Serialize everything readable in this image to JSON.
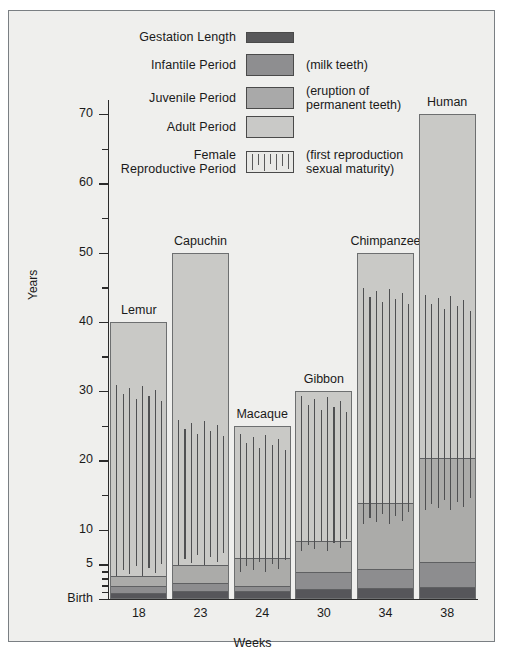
{
  "chart_data": {
    "type": "bar",
    "title": "",
    "subtitle": "",
    "xlabel": "Weeks",
    "ylabel": "Years",
    "ylim": [
      0,
      73
    ],
    "grid": false,
    "legend_position": "top-center",
    "y_ticks_major": [
      {
        "value": 0,
        "label": "Birth"
      },
      {
        "value": 5,
        "label": "5"
      },
      {
        "value": 10,
        "label": "10"
      },
      {
        "value": 20,
        "label": "20"
      },
      {
        "value": 30,
        "label": "30"
      },
      {
        "value": 40,
        "label": "40"
      },
      {
        "value": 50,
        "label": "50"
      },
      {
        "value": 60,
        "label": "60"
      },
      {
        "value": 70,
        "label": "70"
      }
    ],
    "y_ticks_minor": [
      1,
      2,
      3,
      4,
      15,
      25,
      35,
      45,
      55,
      65
    ],
    "categories": [
      "Lemur",
      "Capuchin",
      "Macaque",
      "Gibbon",
      "Chimpanzee",
      "Human"
    ],
    "x_tick_labels": [
      "18",
      "23",
      "24",
      "30",
      "34",
      "38"
    ],
    "legend": [
      {
        "key": "gestation",
        "label": "Gestation Length",
        "note": "",
        "color": "#56565a"
      },
      {
        "key": "infantile",
        "label": "Infantile Period",
        "note": "(milk teeth)",
        "color": "#8d8d8f"
      },
      {
        "key": "juvenile",
        "label": "Juvenile Period",
        "note": "(eruption of\npermanent teeth)",
        "color": "#ababa9"
      },
      {
        "key": "adult",
        "label": "Adult Period",
        "note": "",
        "color": "#c9c9c6"
      },
      {
        "key": "reproductive",
        "label": "Female\nReproductive Period",
        "note": "(first reproduction\nsexual maturity)",
        "color": "#e9e9e6"
      }
    ],
    "series": [
      {
        "name": "Lemur",
        "gestation_weeks": 18,
        "total_years": 40,
        "infantile_end": 2.0,
        "juvenile_end": 3.5,
        "reproductive_start": 3.5,
        "reproductive_end": 31.0
      },
      {
        "name": "Capuchin",
        "gestation_weeks": 23,
        "total_years": 50,
        "infantile_end": 2.5,
        "juvenile_end": 5.0,
        "reproductive_start": 5.0,
        "reproductive_end": 26.0
      },
      {
        "name": "Macaque",
        "gestation_weeks": 24,
        "total_years": 25,
        "infantile_end": 2.0,
        "juvenile_end": 6.0,
        "reproductive_start": 4.0,
        "reproductive_end": 24.0
      },
      {
        "name": "Gibbon",
        "gestation_weeks": 30,
        "total_years": 30,
        "infantile_end": 4.0,
        "juvenile_end": 8.5,
        "reproductive_start": 7.0,
        "reproductive_end": 29.5
      },
      {
        "name": "Chimpanzee",
        "gestation_weeks": 34,
        "total_years": 50,
        "infantile_end": 4.5,
        "juvenile_end": 14.0,
        "reproductive_start": 11.0,
        "reproductive_end": 45.0
      },
      {
        "name": "Human",
        "gestation_weeks": 38,
        "total_years": 70,
        "infantile_end": 5.5,
        "juvenile_end": 20.5,
        "reproductive_start": 13.0,
        "reproductive_end": 44.0
      }
    ]
  }
}
